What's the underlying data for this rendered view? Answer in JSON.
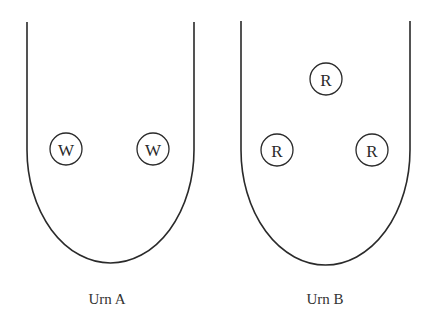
{
  "diagram": {
    "colors": {
      "stroke": "#2a2a2a",
      "background": "#ffffff",
      "text": "#333333"
    },
    "urns": [
      {
        "id": "urn-a",
        "label": "Urn A",
        "label_pos": [
          107,
          304
        ],
        "outline": {
          "left": 27,
          "right": 194,
          "top": 22,
          "straight_to": 150,
          "bottom": 263
        },
        "balls": [
          {
            "letter": "W",
            "cx": 66,
            "cy": 149,
            "r": 16
          },
          {
            "letter": "W",
            "cx": 153,
            "cy": 149,
            "r": 16
          }
        ]
      },
      {
        "id": "urn-b",
        "label": "Urn B",
        "label_pos": [
          325,
          304
        ],
        "outline": {
          "left": 241,
          "right": 410,
          "top": 21,
          "straight_to": 150,
          "bottom": 265
        },
        "balls": [
          {
            "letter": "R",
            "cx": 326,
            "cy": 79,
            "r": 16
          },
          {
            "letter": "R",
            "cx": 277,
            "cy": 150,
            "r": 16
          },
          {
            "letter": "R",
            "cx": 372,
            "cy": 150,
            "r": 16
          }
        ]
      }
    ]
  }
}
